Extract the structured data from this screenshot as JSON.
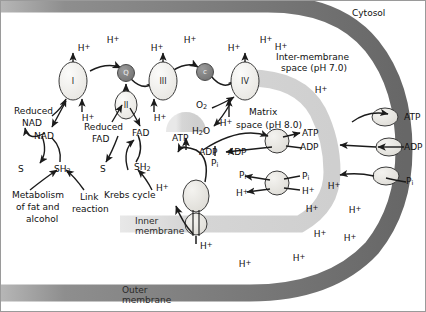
{
  "diagram": {
    "colors": {
      "outer_membrane": "#6e6e6e",
      "inner_membrane": "#d9d9d9",
      "complex_fill": "#f0efec",
      "carrier_fill": "#8a8a8a",
      "stroke": "#2b2b2b",
      "background": "#ffffff"
    }
  },
  "compartments": {
    "cytosol": "Cytosol",
    "intermembrane": "Inter-membrane",
    "intermembrane_ph": "space (pH 7.0)",
    "matrix": "Matrix",
    "matrix_ph": "space (pH 8.0)",
    "inner_membrane_l1": "Inner",
    "inner_membrane_l2": "membrane",
    "outer_membrane_l1": "Outer",
    "outer_membrane_l2": "membrane"
  },
  "complexes": [
    {
      "id": "I",
      "label": "I"
    },
    {
      "id": "II",
      "label": "II"
    },
    {
      "id": "III",
      "label": "III"
    },
    {
      "id": "IV",
      "label": "IV"
    }
  ],
  "carriers": [
    {
      "id": "Q",
      "label": "Q"
    },
    {
      "id": "cytc",
      "label": "c"
    }
  ],
  "proton_labels_top": [
    {
      "text": "H",
      "sup": "+",
      "x": 84,
      "y": 47
    },
    {
      "text": "H",
      "sup": "+",
      "x": 113,
      "y": 39
    },
    {
      "text": "H",
      "sup": "+",
      "x": 157,
      "y": 47
    },
    {
      "text": "H",
      "sup": "+",
      "x": 190,
      "y": 39
    },
    {
      "text": "H",
      "sup": "+",
      "x": 231,
      "y": 47
    },
    {
      "text": "H",
      "sup": "+",
      "x": 263,
      "y": 39
    }
  ],
  "proton_labels_matrix": [
    {
      "text": "H",
      "sup": "+",
      "x": 88,
      "y": 116
    },
    {
      "text": "H",
      "sup": "+",
      "x": 160,
      "y": 116
    },
    {
      "text": "H",
      "sup": "+",
      "x": 222,
      "y": 121
    }
  ],
  "proton_labels_space": [
    {
      "text": "H",
      "sup": "+",
      "x": 280,
      "y": 46
    },
    {
      "text": "H",
      "sup": "+",
      "x": 318,
      "y": 88
    },
    {
      "text": "H",
      "sup": "+",
      "x": 333,
      "y": 184
    },
    {
      "text": "H",
      "sup": "+",
      "x": 352,
      "y": 208
    },
    {
      "text": "H",
      "sup": "+",
      "x": 318,
      "y": 232
    },
    {
      "text": "H",
      "sup": "+",
      "x": 348,
      "y": 236
    },
    {
      "text": "H",
      "sup": "+",
      "x": 297,
      "y": 256
    },
    {
      "text": "H",
      "sup": "+",
      "x": 243,
      "y": 262
    },
    {
      "text": "H",
      "sup": "+",
      "x": 310,
      "y": 207
    }
  ],
  "redox_left": {
    "reduced_nad_l1": "Reduced",
    "reduced_nad_l2": "NAD",
    "nad": "NAD",
    "substrate": "S",
    "substrate_h2": "SH",
    "substrate_h2_sub": "2",
    "source_l1": "Metabolism",
    "source_l2": "of fat and",
    "source_l3": "alcohol",
    "link_l1": "Link",
    "link_l2": "reaction"
  },
  "redox_right": {
    "reduced_fad_l1": "Reduced",
    "reduced_fad_l2": "FAD",
    "fad": "FAD",
    "substrate": "S",
    "substrate_h2": "SH",
    "substrate_h2_sub": "2",
    "krebs": "Krebs cycle"
  },
  "oxygen": {
    "o2": "O",
    "o2_sub": "2",
    "h2o": "H",
    "h2o_sub": "2",
    "h2o_tail": "O"
  },
  "atp_synthase": {
    "atp": "ATP",
    "adp": "ADP",
    "pi": "P",
    "pi_sub": "i",
    "proton_in": "H",
    "proton_in_sup": "+",
    "proton_out": "H",
    "proton_out_sup": "+"
  },
  "inner_transporters": [
    {
      "name": "atp-adp-translocase",
      "left_top": "ATP",
      "left_bottom": "ADP",
      "right_top": "ATP",
      "right_bottom": "ADP"
    },
    {
      "name": "phosphate-symporter",
      "left_top": "P",
      "left_top_sub": "i",
      "left_bottom": "H",
      "left_bottom_sup": "+",
      "right_top": "P",
      "right_top_sub": "i",
      "right_bottom": "H",
      "right_bottom_sup": "+"
    }
  ],
  "outer_transporters": [
    {
      "name": "atp-porin",
      "label": "ATP"
    },
    {
      "name": "adp-porin",
      "label": "ADP"
    },
    {
      "name": "phosphate-porin",
      "label": "P",
      "sub": "i"
    }
  ]
}
